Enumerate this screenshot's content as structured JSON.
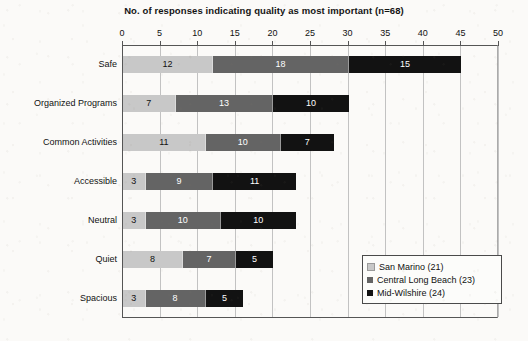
{
  "chart_data": {
    "type": "bar",
    "orientation": "horizontal",
    "stacked": true,
    "title": "No. of responses indicating quality as most important (n=68)",
    "xlabel": "",
    "ylabel": "",
    "xlim": [
      0,
      50
    ],
    "xticks": [
      0,
      5,
      10,
      15,
      20,
      25,
      30,
      35,
      40,
      45,
      50
    ],
    "grid": true,
    "grid_axis": "x",
    "axis_position": "top",
    "legend_position": "lower-right-inside",
    "categories": [
      "Safe",
      "Organized Programs",
      "Common Activities",
      "Accessible",
      "Neutral",
      "Quiet",
      "Spacious"
    ],
    "series": [
      {
        "name": "San Marino (21)",
        "color": "#c8c8c8",
        "values": [
          12,
          7,
          11,
          3,
          3,
          8,
          3
        ]
      },
      {
        "name": "Central Long Beach (23)",
        "color": "#646464",
        "values": [
          18,
          13,
          10,
          9,
          10,
          7,
          8
        ]
      },
      {
        "name": "Mid-Wilshire (24)",
        "color": "#121212",
        "values": [
          15,
          10,
          7,
          11,
          10,
          5,
          5
        ]
      }
    ],
    "totals": [
      45,
      30,
      28,
      23,
      23,
      20,
      16
    ]
  }
}
